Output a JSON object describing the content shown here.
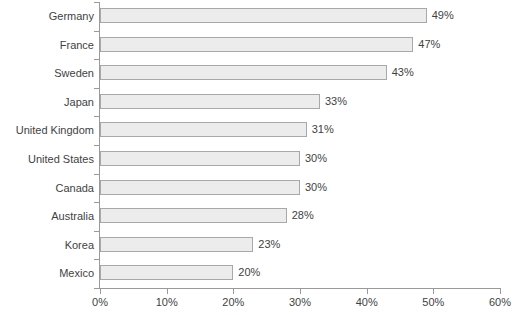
{
  "chart_data": {
    "type": "bar",
    "orientation": "horizontal",
    "title": "",
    "subtitle": "",
    "xlabel": "",
    "ylabel": "",
    "xlim": [
      0,
      60
    ],
    "grid": false,
    "legend": null,
    "value_suffix": "%",
    "categories": [
      "Germany",
      "France",
      "Sweden",
      "Japan",
      "United Kingdom",
      "United States",
      "Canada",
      "Australia",
      "Korea",
      "Mexico"
    ],
    "values": [
      49,
      47,
      43,
      33,
      31,
      30,
      30,
      28,
      23,
      20
    ],
    "data_labels": [
      "49%",
      "47%",
      "43%",
      "33%",
      "31%",
      "30%",
      "30%",
      "28%",
      "23%",
      "20%"
    ],
    "xticks": [
      0,
      10,
      20,
      30,
      40,
      50,
      60
    ],
    "xtick_labels": [
      "0%",
      "10%",
      "20%",
      "30%",
      "40%",
      "50%",
      "60%"
    ],
    "colors": {
      "bar_fill": "#ececec",
      "bar_border": "#a8a8a8",
      "axis": "#9a9a9a",
      "text": "#3f3f3f",
      "background": "#ffffff"
    }
  }
}
